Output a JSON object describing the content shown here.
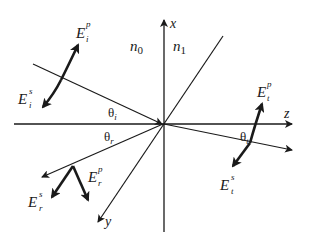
{
  "diagram": {
    "colors": {
      "ink": "#1a1a1a",
      "background": "#ffffff"
    },
    "axes": {
      "x": {
        "label": "x"
      },
      "y": {
        "label": "y"
      },
      "z": {
        "label": "z"
      }
    },
    "media": {
      "incident": {
        "label": "n",
        "sub": "0"
      },
      "transmitted": {
        "label": "n",
        "sub": "1"
      }
    },
    "angles": {
      "incident": {
        "symbol": "θ",
        "sub": "i"
      },
      "reflected": {
        "symbol": "θ",
        "sub": "r"
      },
      "transmitted": {
        "symbol": "θ",
        "sub": "t"
      }
    },
    "fields": {
      "incident_p": {
        "base": "E",
        "sub": "i",
        "sup": "p"
      },
      "incident_s": {
        "base": "E",
        "sub": "i",
        "sup": "s"
      },
      "reflected_p": {
        "base": "E",
        "sub": "r",
        "sup": "p"
      },
      "reflected_s": {
        "base": "E",
        "sub": "r",
        "sup": "s"
      },
      "transmitted_p": {
        "base": "E",
        "sub": "t",
        "sup": "p"
      },
      "transmitted_s": {
        "base": "E",
        "sub": "t",
        "sup": "s"
      }
    }
  }
}
